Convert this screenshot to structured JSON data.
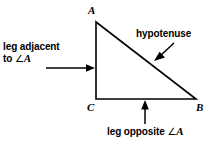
{
  "figure": {
    "background_color": "#ffffff",
    "stroke_color": "#000000"
  },
  "triangle": {
    "vertices": [
      {
        "name": "A",
        "label": "A",
        "x": 96,
        "y": 22
      },
      {
        "name": "C",
        "label": "C",
        "x": 96,
        "y": 99
      },
      {
        "name": "B",
        "label": "B",
        "x": 196,
        "y": 99
      }
    ]
  },
  "callouts": {
    "adjacent": {
      "line1": "leg adjacent",
      "line2_prefix": "to ",
      "angle_symbol": "∠",
      "angle_vertex": "A"
    },
    "hypotenuse": {
      "text": "hypotenuse"
    },
    "opposite": {
      "text_prefix": "leg opposite ",
      "angle_symbol": "∠",
      "angle_vertex": "A"
    }
  }
}
